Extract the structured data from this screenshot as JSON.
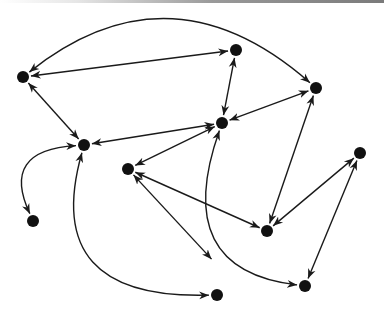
{
  "diagram": {
    "type": "directed-graph",
    "colors": {
      "node": "#111111",
      "edge": "#1a1a1a",
      "background": "#ffffff"
    },
    "nodes": [
      {
        "id": "A",
        "x": 23,
        "y": 77
      },
      {
        "id": "B",
        "x": 236,
        "y": 50
      },
      {
        "id": "C",
        "x": 316,
        "y": 88
      },
      {
        "id": "D",
        "x": 84,
        "y": 145
      },
      {
        "id": "E",
        "x": 222,
        "y": 123
      },
      {
        "id": "F",
        "x": 128,
        "y": 169
      },
      {
        "id": "G",
        "x": 360,
        "y": 153
      },
      {
        "id": "H",
        "x": 33,
        "y": 221
      },
      {
        "id": "I",
        "x": 267,
        "y": 231
      },
      {
        "id": "J",
        "x": 305,
        "y": 286
      },
      {
        "id": "K",
        "x": 217,
        "y": 295
      }
    ],
    "edges": [
      {
        "from": "A",
        "to": "C",
        "path": "M 316 88 Q 170 -40 23 77",
        "bidirectional": true
      },
      {
        "from": "A",
        "to": "B",
        "path": "M 23 77 L 236 50",
        "bidirectional": true
      },
      {
        "from": "A",
        "to": "D",
        "path": "M 23 77 L 84 145",
        "bidirectional": true
      },
      {
        "from": "B",
        "to": "E",
        "path": "M 236 50 L 222 123",
        "bidirectional": true
      },
      {
        "from": "D",
        "to": "E",
        "path": "M 84 145 L 222 123",
        "bidirectional": true
      },
      {
        "from": "E",
        "to": "C",
        "path": "M 222 123 L 316 88",
        "bidirectional": true
      },
      {
        "from": "E",
        "to": "F",
        "path": "M 222 123 L 128 169",
        "bidirectional": true
      },
      {
        "from": "F",
        "to": "I",
        "path": "M 128 169 L 267 231",
        "bidirectional": true
      },
      {
        "from": "F",
        "to": "K",
        "path": "M 128 169 L 217 265",
        "bidirectional": true
      },
      {
        "from": "D",
        "to": "K",
        "path": "M 84 145 Q 40 300 217 295",
        "bidirectional": true
      },
      {
        "from": "E",
        "to": "J",
        "path": "M 222 123 Q 170 270 305 286",
        "bidirectional": true
      },
      {
        "from": "C",
        "to": "I",
        "path": "M 316 88 L 267 231",
        "bidirectional": true
      },
      {
        "from": "G",
        "to": "I",
        "path": "M 360 153 L 267 231",
        "bidirectional": true
      },
      {
        "from": "G",
        "to": "J",
        "path": "M 360 153 L 305 286",
        "bidirectional": true
      },
      {
        "from": "D",
        "to": "H",
        "path": "M 84 145 Q 0 150 33 221",
        "bidirectional": true
      }
    ]
  }
}
